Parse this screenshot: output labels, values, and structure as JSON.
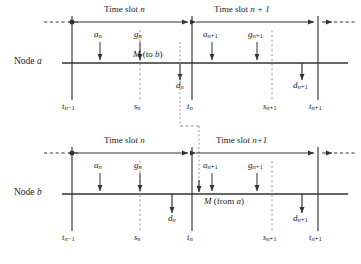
{
  "figure": {
    "type": "timing-diagram"
  },
  "colors": {
    "line": "#333333",
    "dashed": "#9a9a9a",
    "dotted": "#9a9a9a",
    "text": "#1a1a1a",
    "background": "#ffffff"
  },
  "panels": [
    {
      "id": "node-a",
      "node_label_prefix": "Node ",
      "node_label_symbol": "a",
      "slots": [
        {
          "id": "slot-n",
          "label_prefix": "Time slot ",
          "label_symbol": "n"
        },
        {
          "id": "slot-n1",
          "label_prefix": "Time slot ",
          "label_symbol": "n + 1"
        }
      ],
      "above_arrows": [
        {
          "id": "a-n",
          "base": "a",
          "sub": "n",
          "x": 100
        },
        {
          "id": "g-n",
          "base": "g",
          "sub": "n",
          "x": 140
        },
        {
          "id": "a-n1",
          "base": "a",
          "sub": "n+1",
          "x": 212
        },
        {
          "id": "g-n1",
          "base": "g",
          "sub": "n+1",
          "x": 257
        }
      ],
      "below_arrows": [
        {
          "id": "d-n",
          "base": "d",
          "sub": "n",
          "x": 180
        },
        {
          "id": "d-n1",
          "base": "d",
          "sub": "n+1",
          "x": 302
        }
      ],
      "ticks": [
        {
          "id": "t-n-1",
          "base": "t",
          "sub": "n-1",
          "x": 72
        },
        {
          "id": "s-n",
          "base": "s",
          "sub": "n",
          "x": 140
        },
        {
          "id": "t-n",
          "base": "t",
          "sub": "n",
          "x": 192
        },
        {
          "id": "s-n1",
          "base": "s",
          "sub": "n+1",
          "x": 272
        },
        {
          "id": "t-n1",
          "base": "t",
          "sub": "n+1",
          "x": 318
        }
      ],
      "message": {
        "id": "msg-to-b",
        "prefix": "M",
        "paren": " (to ",
        "symbol": "b",
        "close": ")"
      }
    },
    {
      "id": "node-b",
      "node_label_prefix": "Node ",
      "node_label_symbol": "b",
      "slots": [
        {
          "id": "slot-n",
          "label_prefix": "Time slot ",
          "label_symbol": "n"
        },
        {
          "id": "slot-n1",
          "label_prefix": "Time slot ",
          "label_symbol": "n+1"
        }
      ],
      "above_arrows": [
        {
          "id": "a-n",
          "base": "a",
          "sub": "n",
          "x": 100
        },
        {
          "id": "g-n",
          "base": "g",
          "sub": "n",
          "x": 140
        },
        {
          "id": "a-n1",
          "base": "a",
          "sub": "n+1",
          "x": 212
        },
        {
          "id": "g-n1",
          "base": "g",
          "sub": "n+1",
          "x": 257
        }
      ],
      "below_arrows": [
        {
          "id": "d-n",
          "base": "d",
          "sub": "n",
          "x": 172
        },
        {
          "id": "d-n1",
          "base": "d",
          "sub": "n+1",
          "x": 302
        }
      ],
      "ticks": [
        {
          "id": "t-n-1",
          "base": "t",
          "sub": "n-1",
          "x": 72
        },
        {
          "id": "s-n",
          "base": "s",
          "sub": "n",
          "x": 140
        },
        {
          "id": "t-n",
          "base": "t",
          "sub": "n",
          "x": 192
        },
        {
          "id": "s-n1",
          "base": "s",
          "sub": "n+1",
          "x": 272
        },
        {
          "id": "t-n1",
          "base": "t",
          "sub": "n+1",
          "x": 318
        }
      ],
      "message": {
        "id": "msg-from-a",
        "prefix": "M",
        "paren": " (from ",
        "symbol": "a",
        "close": ")"
      }
    }
  ],
  "geometry": {
    "axis_left": 62,
    "axis_right": 348,
    "panel_a_axis_y": 63,
    "panel_b_axis_y": 194,
    "panel_a_slotbar_y": 22,
    "panel_b_slotbar_y": 153
  }
}
